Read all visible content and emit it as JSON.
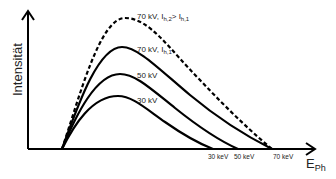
{
  "diagram": {
    "title": "",
    "ylabel": "Intensität",
    "xlabel_main": "E",
    "xlabel_sub": "Ph",
    "curves": [
      {
        "id": "70kv-i2",
        "label_parts": [
          "70 kV, I",
          "h,2",
          "> I",
          "h,1"
        ],
        "style": "dashed",
        "peak": [
          125,
          18
        ],
        "end_kev": "70 keV"
      },
      {
        "id": "70kv-i1",
        "label_parts": [
          "70 kV, I",
          "h,1"
        ],
        "style": "solid",
        "peak": [
          122,
          47
        ],
        "end_kev": "70 keV"
      },
      {
        "id": "50kv",
        "label": "50 kV",
        "style": "solid",
        "peak": [
          120,
          74
        ],
        "end_kev": "50 keV"
      },
      {
        "id": "30kv",
        "label": "30 kV",
        "style": "solid",
        "peak": [
          118,
          96
        ],
        "end_kev": "30 keV"
      }
    ],
    "x_ticks": [
      "30 keV",
      "50 keV",
      "70 keV"
    ],
    "colors": {
      "line": "#000000",
      "text": "#222222",
      "background": "#ffffff"
    }
  }
}
